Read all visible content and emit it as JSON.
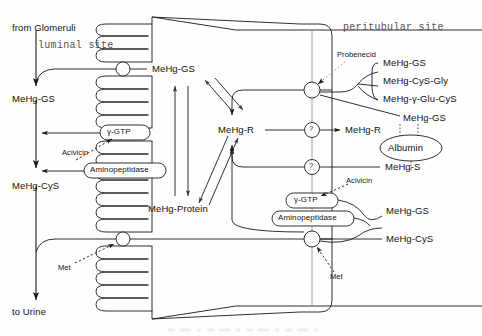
{
  "figure": {
    "type": "biological-pathway-diagram",
    "compartments": {
      "luminal": "luminal site",
      "peritubular": "peritubular site"
    },
    "flow_labels": {
      "inflow": "from Glomeruli",
      "outflow": "to Urine"
    },
    "luminal_species": {
      "top_transported": "MeHg-GS",
      "filtered": "MeHg-GS",
      "after_peptidases": "MeHg-CyS"
    },
    "intracellular": {
      "receptor_bound": "MeHg-R",
      "protein_bound": "MeHg-Protein"
    },
    "luminal_enzymes": [
      {
        "name": "γ-GTP",
        "shape": "rounded-box"
      },
      {
        "name": "Aminopeptidase",
        "shape": "rounded-box"
      }
    ],
    "peritubular_enzymes": [
      {
        "name": "γ-GTP",
        "shape": "rounded-box"
      },
      {
        "name": "Aminopeptidase",
        "shape": "rounded-box"
      }
    ],
    "inhibitors": {
      "luminal_acivicin": "Acivicin",
      "peritubular_acivicin": "Acivicin",
      "probenecid": "Probenecid",
      "luminal_met": "Met",
      "peritubular_met": "Met"
    },
    "peritubular_species": {
      "branch_group": [
        "MeHg-GS",
        "MeHg-CyS-Gly",
        "MeHg-γ-Glu-CyS"
      ],
      "albumin_bound_upper": "MeHg-GS",
      "albumin": "Albumin",
      "albumin_bound_lower": "MeHg-S",
      "receptor_export": "MeHg-R",
      "lower_export_gs": "MeHg-GS",
      "lower_export_cys": "MeHg-CyS"
    },
    "unknown_transporters": [
      "?",
      "?"
    ],
    "caption_fragment": ""
  },
  "colors": {
    "ink": "#1a1a1a",
    "faint": "#6b6b6b",
    "paper": "#fefefe",
    "compartment_text": "#555555"
  }
}
